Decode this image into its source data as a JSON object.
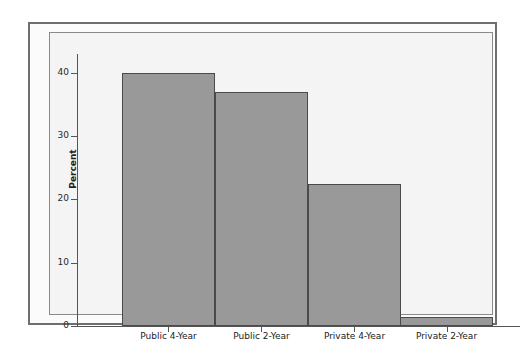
{
  "chart_data": {
    "type": "bar",
    "title": "",
    "xlabel": "",
    "ylabel": "Percent",
    "categories": [
      "Public 4-Year",
      "Public 2-Year",
      "Private 4-Year",
      "Private 2-Year"
    ],
    "values": [
      40,
      37,
      22.5,
      1.5
    ],
    "ylim": [
      0,
      43
    ],
    "yticks": [
      0,
      10,
      20,
      30,
      40
    ],
    "ytick_labels": [
      "0",
      "10",
      "20",
      "30",
      "40"
    ],
    "grid": false,
    "legend": null,
    "bar_color": "#999999",
    "bar_edge_color": "#4a4a4a",
    "plot_background": "#f4f4f4",
    "frame_color": "#6e6e6e"
  }
}
